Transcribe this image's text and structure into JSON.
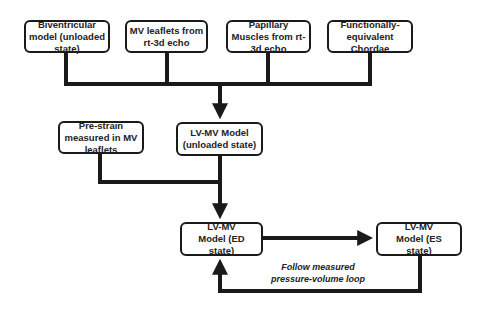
{
  "diagram": {
    "type": "flowchart",
    "colors": {
      "line": "#1a1a1a",
      "box_border": "#1a1a1a",
      "text": "#222222",
      "background": "#ffffff"
    },
    "inputs": [
      {
        "id": "biv",
        "label": "Biventricular model (unloaded state)"
      },
      {
        "id": "mvleaf",
        "label": "MV leaflets from rt-3d echo"
      },
      {
        "id": "pap",
        "label": "Papillary Muscles from rt-3d echo"
      },
      {
        "id": "chordae",
        "label": "Functionally-equivalent Chordae"
      }
    ],
    "prestrain": {
      "label": "Pre-strain measured in MV leaflets"
    },
    "unloaded": {
      "label": "LV-MV Model (unloaded state)"
    },
    "ed": {
      "label": "LV-MV Model (ED state)"
    },
    "es": {
      "label": "LV-MV Model (ES state)"
    },
    "loop_label": "Follow measured pressure-volume loop",
    "edges": [
      {
        "from": "biv",
        "to": "unloaded"
      },
      {
        "from": "mvleaf",
        "to": "unloaded"
      },
      {
        "from": "pap",
        "to": "unloaded"
      },
      {
        "from": "chordae",
        "to": "unloaded"
      },
      {
        "from": "prestrain",
        "to": "ed"
      },
      {
        "from": "unloaded",
        "to": "ed"
      },
      {
        "from": "ed",
        "to": "es"
      },
      {
        "from": "es",
        "to": "ed",
        "label": "Follow measured pressure-volume loop"
      }
    ]
  }
}
